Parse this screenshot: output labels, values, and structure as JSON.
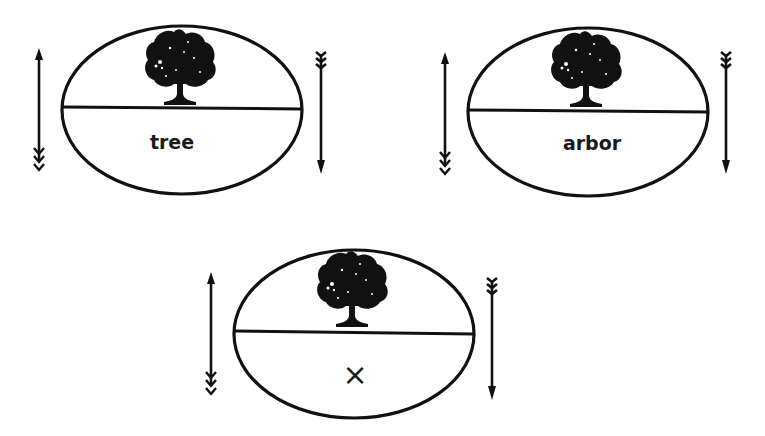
{
  "diagrams": [
    {
      "id": "d1",
      "label": "tree",
      "cx": 182,
      "cy": 110,
      "rx": 120,
      "ry": 84,
      "divider_y": 108,
      "left_arrow_x": 39,
      "right_arrow_x": 321
    },
    {
      "id": "d2",
      "label": "arbor",
      "cx": 588,
      "cy": 112,
      "rx": 120,
      "ry": 84,
      "divider_y": 111,
      "left_arrow_x": 445,
      "right_arrow_x": 726
    },
    {
      "id": "d3",
      "label": "×",
      "cx": 354,
      "cy": 334,
      "rx": 120,
      "ry": 84,
      "divider_y": 332,
      "left_arrow_x": 211,
      "right_arrow_x": 492
    }
  ],
  "colors": {
    "ink": "#111111",
    "background": "#ffffff"
  }
}
